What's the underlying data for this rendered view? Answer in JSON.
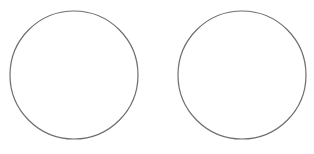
{
  "canvas": {
    "width": 314,
    "height": 154,
    "background": "#ffffff"
  },
  "shapes": [
    {
      "id": "left-circle",
      "type": "circle",
      "cx": 74,
      "cy": 75,
      "r": 64,
      "stroke": "#6e6e6e",
      "fill": "#ffffff"
    },
    {
      "id": "right-circle",
      "type": "circle",
      "cx": 242,
      "cy": 75,
      "r": 64,
      "stroke": "#6e6e6e",
      "fill": "#ffffff"
    }
  ]
}
